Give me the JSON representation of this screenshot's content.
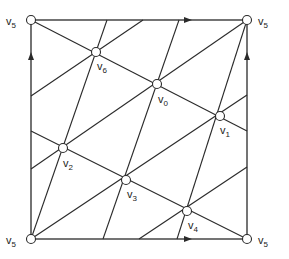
{
  "diagram": {
    "title": "",
    "border": {
      "corners": [
        [
          31,
          20
        ],
        [
          247,
          20
        ],
        [
          247,
          239
        ],
        [
          31,
          239
        ]
      ],
      "arrows": [
        {
          "edge": "top",
          "direction": "right",
          "at": [
            187,
            20
          ]
        },
        {
          "edge": "bottom",
          "direction": "right",
          "at": [
            187,
            239
          ]
        },
        {
          "edge": "left",
          "direction": "up",
          "at": [
            31,
            57
          ]
        },
        {
          "edge": "right",
          "direction": "up",
          "at": [
            247,
            57
          ]
        }
      ]
    },
    "vertices": [
      {
        "id": "v5_tl",
        "label": "v",
        "sub": "5",
        "x": 31,
        "y": 20,
        "lx": 6,
        "ly": 25
      },
      {
        "id": "v5_tr",
        "label": "v",
        "sub": "5",
        "x": 247,
        "y": 20,
        "lx": 258,
        "ly": 25
      },
      {
        "id": "v5_bl",
        "label": "v",
        "sub": "5",
        "x": 31,
        "y": 239,
        "lx": 6,
        "ly": 244
      },
      {
        "id": "v5_br",
        "label": "v",
        "sub": "5",
        "x": 247,
        "y": 239,
        "lx": 258,
        "ly": 244
      },
      {
        "id": "v6",
        "label": "v",
        "sub": "6",
        "x": 96,
        "y": 52,
        "lx": 97,
        "ly": 70
      },
      {
        "id": "v0",
        "label": "v",
        "sub": "0",
        "x": 157,
        "y": 84,
        "lx": 158,
        "ly": 103
      },
      {
        "id": "v1",
        "label": "v",
        "sub": "1",
        "x": 220,
        "y": 116,
        "lx": 220,
        "ly": 134
      },
      {
        "id": "v2",
        "label": "v",
        "sub": "2",
        "x": 63,
        "y": 148,
        "lx": 63,
        "ly": 167
      },
      {
        "id": "v3",
        "label": "v",
        "sub": "3",
        "x": 126,
        "y": 180,
        "lx": 127,
        "ly": 198
      },
      {
        "id": "v4",
        "label": "v",
        "sub": "4",
        "x": 187,
        "y": 211,
        "lx": 188,
        "ly": 229
      }
    ],
    "edges": [
      {
        "from": [
          31,
          239
        ],
        "to": [
          107,
          20
        ]
      },
      {
        "from": [
          103,
          239
        ],
        "to": [
          179,
          20
        ]
      },
      {
        "from": [
          177,
          239
        ],
        "to": [
          247,
          20
        ]
      },
      {
        "from": [
          31,
          239
        ],
        "to": [
          247,
          95
        ]
      },
      {
        "from": [
          31,
          169
        ],
        "to": [
          247,
          20
        ]
      },
      {
        "from": [
          31,
          96
        ],
        "to": [
          143,
          20
        ]
      },
      {
        "from": [
          139,
          239
        ],
        "to": [
          247,
          167
        ]
      },
      {
        "from": [
          31,
          20
        ],
        "to": [
          247,
          131
        ]
      },
      {
        "from": [
          31,
          131
        ],
        "to": [
          247,
          239
        ]
      }
    ]
  }
}
